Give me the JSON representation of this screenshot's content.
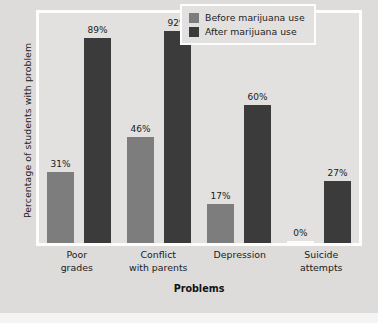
{
  "chart_data": {
    "type": "bar",
    "title": "",
    "xlabel": "Problems",
    "ylabel": "Percentage of students with problem",
    "ylim": [
      0,
      100
    ],
    "grid": false,
    "legend_position": "top-right",
    "categories": [
      "Poor grades",
      "Conflict with parents",
      "Depression",
      "Suicide attempts"
    ],
    "category_lines": [
      [
        "Poor",
        "grades"
      ],
      [
        "Conflict",
        "with parents"
      ],
      [
        "Depression",
        ""
      ],
      [
        "Suicide",
        "attempts"
      ]
    ],
    "series": [
      {
        "name": "Before marijuana use",
        "color": "#7d7d7d",
        "values": [
          31,
          46,
          17,
          0
        ],
        "labels": [
          "31%",
          "46%",
          "17%",
          "0%"
        ]
      },
      {
        "name": "After marijuana use",
        "color": "#3b3b3b",
        "values": [
          89,
          92,
          60,
          27
        ],
        "labels": [
          "89%",
          "92%",
          "60%",
          "27%"
        ]
      }
    ]
  },
  "legend": {
    "items": [
      {
        "label": "Before marijuana use",
        "color": "#7d7d7d"
      },
      {
        "label": "After marijuana use",
        "color": "#3b3b3b"
      }
    ]
  },
  "colors": {
    "background": "#dddcda",
    "plot_background": "#e2e1df",
    "frame": "#fdfdfd",
    "before": "#7d7d7d",
    "after": "#3b3b3b",
    "text": "#1a1a1a"
  }
}
